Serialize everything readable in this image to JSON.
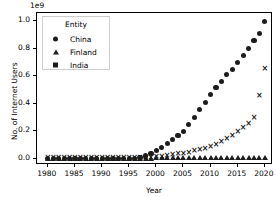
{
  "chart_data": {
    "type": "scatter",
    "title": "",
    "xlabel": "Year",
    "ylabel": "No. of Internet Users",
    "y_offset_text": "1e9",
    "y_offset_multiplier": 1000000000,
    "xlim": [
      1978.0,
      2021.5
    ],
    "ylim": [
      -0.045,
      1.06
    ],
    "xticks": [
      1980,
      1985,
      1990,
      1995,
      2000,
      2005,
      2010,
      2015,
      2020
    ],
    "xtick_labels": [
      "1980",
      "1985",
      "1990",
      "1995",
      "2000",
      "2005",
      "2010",
      "2015",
      "2020"
    ],
    "yticks": [
      0.0,
      0.2,
      0.4,
      0.6,
      0.8,
      1.0
    ],
    "ytick_labels": [
      "0.0",
      "0.2",
      "0.4",
      "0.6",
      "0.8",
      "1.0"
    ],
    "grid": false,
    "legend": {
      "title": "Entity",
      "position": "upper left",
      "entries": [
        {
          "label": "China",
          "marker": "circle"
        },
        {
          "label": "Finland",
          "marker": "triangle"
        },
        {
          "label": "India",
          "marker": "square"
        }
      ]
    },
    "series": [
      {
        "name": "China",
        "marker": "circle",
        "x": [
          1980,
          1981,
          1982,
          1983,
          1984,
          1985,
          1986,
          1987,
          1988,
          1989,
          1990,
          1991,
          1992,
          1993,
          1994,
          1995,
          1996,
          1997,
          1998,
          1999,
          2000,
          2001,
          2002,
          2003,
          2004,
          2005,
          2006,
          2007,
          2008,
          2009,
          2010,
          2011,
          2012,
          2013,
          2014,
          2015,
          2016,
          2017,
          2018,
          2019,
          2020
        ],
        "y": [
          0.0,
          0.0,
          0.0,
          0.0,
          0.0,
          0.0,
          0.0,
          0.0,
          0.0,
          0.0,
          0.0,
          0.0,
          0.0,
          0.0,
          0.0,
          0.003,
          0.005,
          0.009,
          0.021,
          0.04,
          0.062,
          0.084,
          0.11,
          0.14,
          0.17,
          0.2,
          0.25,
          0.3,
          0.36,
          0.41,
          0.47,
          0.52,
          0.56,
          0.61,
          0.65,
          0.7,
          0.75,
          0.8,
          0.86,
          0.91,
          1.0
        ]
      },
      {
        "name": "Finland",
        "marker": "triangle",
        "x": [
          1980,
          1981,
          1982,
          1983,
          1984,
          1985,
          1986,
          1987,
          1988,
          1989,
          1990,
          1991,
          1992,
          1993,
          1994,
          1995,
          1996,
          1997,
          1998,
          1999,
          2000,
          2001,
          2002,
          2003,
          2004,
          2005,
          2006,
          2007,
          2008,
          2009,
          2010,
          2011,
          2012,
          2013,
          2014,
          2015,
          2016,
          2017,
          2018,
          2019,
          2020
        ],
        "y": [
          0.0,
          0.0,
          0.0,
          0.0,
          0.0,
          0.0,
          0.0,
          0.0,
          0.0,
          0.0,
          0.0,
          0.0,
          0.0,
          0.0,
          0.0,
          0.0,
          0.001,
          0.001,
          0.002,
          0.002,
          0.003,
          0.003,
          0.003,
          0.004,
          0.004,
          0.004,
          0.004,
          0.004,
          0.005,
          0.005,
          0.005,
          0.005,
          0.005,
          0.005,
          0.005,
          0.005,
          0.005,
          0.005,
          0.005,
          0.005,
          0.005
        ]
      },
      {
        "name": "India",
        "marker": "x",
        "x": [
          1980,
          1981,
          1982,
          1983,
          1984,
          1985,
          1986,
          1987,
          1988,
          1989,
          1990,
          1991,
          1992,
          1993,
          1994,
          1995,
          1996,
          1997,
          1998,
          1999,
          2000,
          2001,
          2002,
          2003,
          2004,
          2005,
          2006,
          2007,
          2008,
          2009,
          2010,
          2011,
          2012,
          2013,
          2014,
          2015,
          2016,
          2017,
          2018,
          2019,
          2020
        ],
        "y": [
          0.0,
          0.0,
          0.0,
          0.0,
          0.0,
          0.0,
          0.0,
          0.0,
          0.0,
          0.0,
          0.0,
          0.0,
          0.0,
          0.0,
          0.0,
          0.0,
          0.001,
          0.002,
          0.003,
          0.005,
          0.006,
          0.008,
          0.016,
          0.023,
          0.028,
          0.033,
          0.04,
          0.05,
          0.06,
          0.07,
          0.08,
          0.1,
          0.12,
          0.14,
          0.16,
          0.19,
          0.22,
          0.25,
          0.29,
          0.45,
          0.65
        ]
      }
    ],
    "annotations": [
      {
        "text": "",
        "x": 2019,
        "y": 0.45,
        "series": "India"
      },
      {
        "text": "",
        "x": 2020,
        "y": 0.65,
        "series": "India"
      }
    ]
  }
}
